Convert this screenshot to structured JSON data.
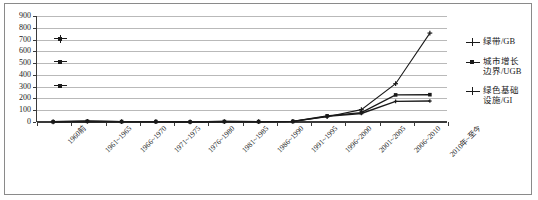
{
  "chart_data": {
    "type": "line",
    "title": "",
    "subtitle": "",
    "xlabel": "",
    "ylabel": "",
    "ylim": [
      0,
      900
    ],
    "ytick_step": 100,
    "yticks": [
      "900",
      "800",
      "700",
      "600",
      "500",
      "400",
      "300",
      "200",
      "100",
      "0"
    ],
    "grid": true,
    "legend_position": "right",
    "categories": [
      "1960前",
      "1961~1965",
      "1966~1970",
      "1971~1975",
      "1976~1980",
      "1981~1985",
      "1986~1990",
      "1991~1995",
      "1996~2000",
      "2001~2005",
      "2006~2010",
      "2010年~至今"
    ],
    "series": [
      {
        "name": "绿带/GB",
        "marker": "cross",
        "values": [
          2,
          6,
          3,
          3,
          1,
          4,
          3,
          5,
          45,
          105,
          325,
          755
        ]
      },
      {
        "name": "城市增长\n边界/UGB",
        "marker": "square",
        "values": [
          2,
          6,
          3,
          3,
          1,
          4,
          3,
          5,
          52,
          80,
          230,
          232
        ]
      },
      {
        "name": "绿色基础\n设施/GI",
        "marker": "cross-small",
        "values": [
          2,
          6,
          3,
          3,
          1,
          4,
          3,
          5,
          48,
          72,
          175,
          178
        ]
      }
    ],
    "stray_markers": [
      {
        "name": "stray-key-700",
        "y_value": 710
      },
      {
        "name": "stray-key-500",
        "y_value": 515
      },
      {
        "name": "stray-key-300",
        "y_value": 310
      }
    ]
  },
  "legend": {
    "entries": [
      {
        "label": "绿带/GB"
      },
      {
        "label": "城市增长\n边界/UGB"
      },
      {
        "label": "绿色基础\n设施/GI"
      }
    ]
  }
}
